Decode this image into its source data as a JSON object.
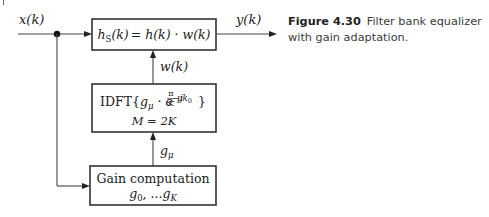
{
  "caption": {
    "figure_number": "Figure 4.30",
    "text": "Filter bank equalizer with gain adaptation."
  },
  "diagram": {
    "signals": {
      "input": "x(k)",
      "output": "y(k)",
      "window": "w(k)",
      "gain": "g",
      "gain_sub": "μ"
    },
    "blocks": {
      "filter": {
        "lhs_base": "h",
        "lhs_sub": "S",
        "lhs_arg": "(k)",
        "rhs": "= h(k) · w(k)"
      },
      "idft": {
        "prefix": "IDFT{",
        "g": "g",
        "g_sub": "μ",
        "mid": " · e",
        "exp_j": "−j",
        "exp_num": "π",
        "exp_den": "K",
        "exp_rest": "μk",
        "exp_rest_sub": "0",
        "suffix": "}",
        "param": "M = 2K"
      },
      "gain_computation": {
        "title": "Gain computation",
        "g0": "g",
        "g0_sub": "0",
        "sep": ", ...",
        "gK": "g",
        "gK_sub": "K"
      }
    },
    "colors": {
      "line": "#444444",
      "text": "#222222",
      "caption": "#3a3a3a"
    }
  }
}
